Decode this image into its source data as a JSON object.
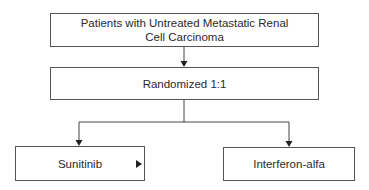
{
  "diagram": {
    "type": "flowchart",
    "nodes": [
      {
        "id": "population",
        "label_line1": "Patients with Untreated Metastatic Renal",
        "label_line2": "Cell Carcinoma"
      },
      {
        "id": "randomization",
        "label": "Randomized 1:1"
      },
      {
        "id": "arm_a",
        "label": "Sunitinib"
      },
      {
        "id": "arm_b",
        "label": "Interferon-alfa"
      }
    ],
    "edges": [
      {
        "from": "population",
        "to": "randomization"
      },
      {
        "from": "randomization",
        "to": "arm_a"
      },
      {
        "from": "randomization",
        "to": "arm_b"
      }
    ],
    "colors": {
      "line": "#444444",
      "border": "#555555",
      "text": "#2a2a2a"
    }
  }
}
